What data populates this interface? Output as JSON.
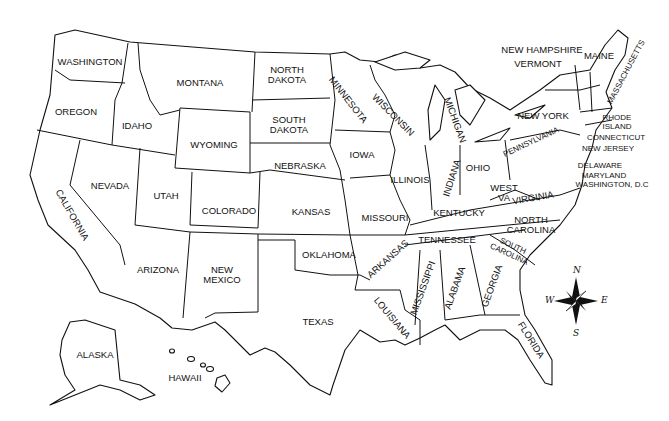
{
  "map": {
    "title": "United States",
    "states": [
      {
        "id": "washington",
        "label": "WASHINGTON",
        "x": 90,
        "y": 62,
        "rot": 0
      },
      {
        "id": "oregon",
        "label": "OREGON",
        "x": 76,
        "y": 112,
        "rot": 0
      },
      {
        "id": "california",
        "label": "CALIFORNIA",
        "x": 72,
        "y": 215,
        "rot": 60
      },
      {
        "id": "nevada",
        "label": "NEVADA",
        "x": 110,
        "y": 186,
        "rot": 0
      },
      {
        "id": "idaho",
        "label": "IDAHO",
        "x": 137,
        "y": 126,
        "rot": 0
      },
      {
        "id": "montana",
        "label": "MONTANA",
        "x": 200,
        "y": 83,
        "rot": 0
      },
      {
        "id": "wyoming",
        "label": "WYOMING",
        "x": 214,
        "y": 145,
        "rot": 0
      },
      {
        "id": "utah",
        "label": "UTAH",
        "x": 166,
        "y": 196,
        "rot": 0
      },
      {
        "id": "colorado",
        "label": "COLORADO",
        "x": 229,
        "y": 211,
        "rot": 0
      },
      {
        "id": "arizona",
        "label": "ARIZONA",
        "x": 158,
        "y": 270,
        "rot": 0
      },
      {
        "id": "new-mexico",
        "label": "NEW\nMEXICO",
        "x": 222,
        "y": 275,
        "rot": 0
      },
      {
        "id": "north-dakota",
        "label": "NORTH\nDAKOTA",
        "x": 287,
        "y": 75,
        "rot": 0
      },
      {
        "id": "south-dakota",
        "label": "SOUTH\nDAKOTA",
        "x": 289,
        "y": 125,
        "rot": 0
      },
      {
        "id": "nebraska",
        "label": "NEBRASKA",
        "x": 300,
        "y": 166,
        "rot": 0
      },
      {
        "id": "kansas",
        "label": "KANSAS",
        "x": 311,
        "y": 212,
        "rot": 0
      },
      {
        "id": "oklahoma",
        "label": "OKLAHOMA",
        "x": 329,
        "y": 255,
        "rot": 0
      },
      {
        "id": "texas",
        "label": "TEXAS",
        "x": 318,
        "y": 322,
        "rot": 0
      },
      {
        "id": "minnesota",
        "label": "MINNESOTA",
        "x": 348,
        "y": 100,
        "rot": 52
      },
      {
        "id": "iowa",
        "label": "IOWA",
        "x": 362,
        "y": 155,
        "rot": 0
      },
      {
        "id": "missouri",
        "label": "MISSOURI",
        "x": 385,
        "y": 218,
        "rot": 0
      },
      {
        "id": "arkansas",
        "label": "ARKANSAS",
        "x": 388,
        "y": 259,
        "rot": -42
      },
      {
        "id": "louisiana",
        "label": "LOUISIANA",
        "x": 392,
        "y": 318,
        "rot": 50
      },
      {
        "id": "wisconsin",
        "label": "WISCONSIN",
        "x": 393,
        "y": 115,
        "rot": 45
      },
      {
        "id": "illinois",
        "label": "ILLINOIS",
        "x": 410,
        "y": 180,
        "rot": 0
      },
      {
        "id": "michigan",
        "label": "MICHIGAN",
        "x": 455,
        "y": 120,
        "rot": 70
      },
      {
        "id": "indiana",
        "label": "INDIANA",
        "x": 452,
        "y": 178,
        "rot": -72
      },
      {
        "id": "ohio",
        "label": "OHIO",
        "x": 478,
        "y": 168,
        "rot": 0
      },
      {
        "id": "kentucky",
        "label": "KENTUCKY",
        "x": 459,
        "y": 213,
        "rot": 0
      },
      {
        "id": "tennessee",
        "label": "TENNESSEE",
        "x": 447,
        "y": 240,
        "rot": 0
      },
      {
        "id": "mississippi",
        "label": "MISSISSIPPI",
        "x": 423,
        "y": 288,
        "rot": -70
      },
      {
        "id": "alabama",
        "label": "ALABAMA",
        "x": 455,
        "y": 288,
        "rot": -70
      },
      {
        "id": "georgia",
        "label": "GEORGIA",
        "x": 492,
        "y": 286,
        "rot": -70
      },
      {
        "id": "florida",
        "label": "FLORIDA",
        "x": 531,
        "y": 340,
        "rot": 58
      },
      {
        "id": "south-carolina",
        "label": "SOUTH\nCAROLINA",
        "x": 511,
        "y": 250,
        "rot": 25
      },
      {
        "id": "north-carolina",
        "label": "NORTH\nCAROLINA",
        "x": 531,
        "y": 225,
        "rot": 0
      },
      {
        "id": "virginia",
        "label": "VIRGINIA",
        "x": 533,
        "y": 198,
        "rot": -10
      },
      {
        "id": "west-virginia",
        "label": "WEST\nVA",
        "x": 504,
        "y": 193,
        "rot": 0
      },
      {
        "id": "pennsylvania",
        "label": "PENNSYLVANIA",
        "x": 531,
        "y": 142,
        "rot": -25
      },
      {
        "id": "new-york",
        "label": "NEW YORK",
        "x": 543,
        "y": 116,
        "rot": 0
      },
      {
        "id": "vermont",
        "label": "VERMONT",
        "x": 538,
        "y": 64,
        "rot": 0
      },
      {
        "id": "new-hampshire",
        "label": "NEW HAMPSHIRE",
        "x": 542,
        "y": 50,
        "rot": 0
      },
      {
        "id": "maine",
        "label": "MAINE",
        "x": 599,
        "y": 56,
        "rot": 0
      },
      {
        "id": "massachusetts",
        "label": "MASSACHUSETTS",
        "x": 626,
        "y": 72,
        "rot": -62
      },
      {
        "id": "rhode-island",
        "label": "RHODE\nISLAND",
        "x": 617,
        "y": 122,
        "rot": 0
      },
      {
        "id": "connecticut",
        "label": "CONNECTICUT",
        "x": 616,
        "y": 137,
        "rot": 0
      },
      {
        "id": "new-jersey",
        "label": "NEW JERSEY",
        "x": 608,
        "y": 148,
        "rot": 0
      },
      {
        "id": "delaware",
        "label": "DELAWARE",
        "x": 600,
        "y": 165,
        "rot": 0
      },
      {
        "id": "maryland",
        "label": "MARYLAND",
        "x": 604,
        "y": 175,
        "rot": 0
      },
      {
        "id": "washington-dc",
        "label": "WASHINGTON, D.C",
        "x": 612,
        "y": 184,
        "rot": 0
      },
      {
        "id": "alaska",
        "label": "ALASKA",
        "x": 95,
        "y": 355,
        "rot": 0
      },
      {
        "id": "hawaii",
        "label": "HAWAII",
        "x": 185,
        "y": 378,
        "rot": 0
      }
    ],
    "compass": {
      "north": "N",
      "south": "S",
      "east": "E",
      "west": "W"
    }
  }
}
